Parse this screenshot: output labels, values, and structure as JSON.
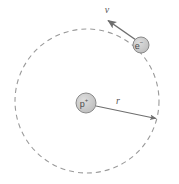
{
  "figure": {
    "background_color": "#ffffff",
    "width": 179,
    "height": 184
  },
  "orbit": {
    "name": "electron-orbit",
    "style": "dashed",
    "stroke_color": "#9a9a9a",
    "center_x": 87,
    "center_y": 101,
    "radius": 72,
    "dash_pattern": "5 4"
  },
  "nucleus": {
    "label": "p",
    "charge": "+",
    "label_full": "p+",
    "center_x": 86,
    "center_y": 103,
    "radius": 10,
    "fill_color": "#c9c9c9",
    "stroke_color": "#8a8a8a"
  },
  "electron": {
    "label": "e",
    "charge": "−",
    "label_full": "e−",
    "center_x": 141,
    "center_y": 45,
    "radius": 8,
    "fill_color": "#c9c9c9",
    "stroke_color": "#8a8a8a"
  },
  "velocity_vector": {
    "label": "v",
    "from_x": 136,
    "from_y": 40,
    "to_x": 106,
    "to_y": 19,
    "stroke_color": "#6e6e6e",
    "label_x": 107,
    "label_y": 8
  },
  "radius_vector": {
    "label": "r",
    "from_x": 96,
    "from_y": 106,
    "to_x": 159,
    "to_y": 119,
    "stroke_color": "#6e6e6e",
    "label_x": 118,
    "label_y": 100
  }
}
